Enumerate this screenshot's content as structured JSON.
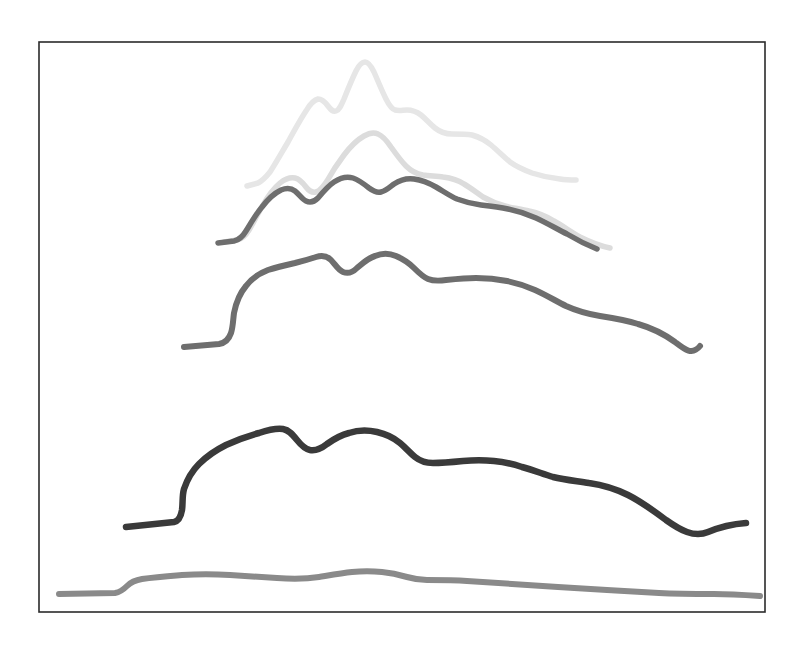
{
  "document": {
    "title": "Nested contour curves",
    "background_color": "#ffffff",
    "width": 807,
    "height": 649
  },
  "frame": {
    "name": "border-frame",
    "x": 39,
    "y": 42,
    "width": 726,
    "height": 570,
    "stroke_color": "#2b2b2b",
    "stroke_width": 1.6
  },
  "chart_data": {
    "type": "line",
    "title": "",
    "subtitle": "",
    "xlabel": "",
    "ylabel": "",
    "grid": false,
    "legend": "none",
    "axis_visible": false,
    "tick_labels": [],
    "annotations": [],
    "xlim": [
      39,
      765
    ],
    "ylim": [
      42,
      612
    ],
    "series": [
      {
        "name": "contour-1-topmost",
        "order": 1,
        "color": "#e6e6e6",
        "stroke_width": 5.5,
        "peak_count": 3,
        "left_end": [
          247,
          186
        ],
        "right_end": [
          576,
          180
        ],
        "apex": [
          364,
          62
        ],
        "path": "M 247 186 L 258 183 C 262 181 266 177 270 172 C 276 163 282 152 288 142 C 294 131 300 120 306 111 C 310 104 314 100 318 99 C 322 99 325 102 328 106 C 331 110 333 112 336 111 C 339 110 341 106 344 99 C 348 89 352 79 356 71 C 359 65 362 62 365 62 C 368 62 371 66 374 72 C 378 81 382 91 386 99 C 389 105 392 109 395 110 C 399 111 403 110 407 110 C 412 110 417 112 421 115 C 426 119 430 124 435 128 C 440 132 446 134 452 134 C 459 134 466 134 472 135 C 479 137 485 140 491 145 C 498 151 504 157 510 162 C 517 167 524 170 532 173 C 541 176 551 178 560 179 C 566 180 572 180 576 180"
      },
      {
        "name": "contour-2-upper",
        "order": 2,
        "color": "#dcdcdc",
        "stroke_width": 5.5,
        "peak_count": 3,
        "left_end": [
          224,
          242
        ],
        "right_end": [
          610,
          248
        ],
        "apex": [
          371,
          133
        ],
        "path": "M 224 242 L 237 240 C 242 239 246 235 249 230 C 254 222 258 213 263 205 C 268 196 274 188 280 183 C 285 179 290 177 295 178 C 300 179 303 183 306 187 C 309 191 312 193 316 192 C 320 191 323 187 327 181 C 332 172 338 163 344 155 C 350 147 357 140 364 136 C 369 133 374 132 378 134 C 383 136 387 141 391 147 C 396 154 401 161 406 166 C 411 171 417 174 423 175 C 430 176 437 176 443 177 C 451 178 458 180 464 184 C 471 188 477 193 483 197 C 490 201 497 204 505 206 C 513 208 521 209 529 211 C 538 213 546 216 554 221 C 563 226 571 232 580 237 C 590 242 600 246 610 248"
      },
      {
        "name": "contour-3-middle",
        "order": 3,
        "color": "#6e6e6e",
        "stroke_width": 5.5,
        "peak_count": 3,
        "left_end": [
          218,
          243
        ],
        "right_end": [
          597,
          249
        ],
        "apex": [
          372,
          182
        ],
        "path": "M 218 243 L 234 241 C 239 240 243 236 246 231 C 251 223 256 214 262 207 C 268 199 275 193 281 190 C 286 188 291 188 295 191 C 299 194 302 199 306 201 C 310 203 314 202 318 198 C 323 192 328 186 334 182 C 340 178 347 176 353 178 C 359 180 364 184 369 188 C 373 191 377 193 381 192 C 386 191 390 187 394 184 C 400 180 407 178 414 179 C 422 180 429 183 436 187 C 443 191 450 196 457 199 C 465 202 473 204 481 205 C 490 206 499 207 508 209 C 518 211 527 214 536 218 C 547 223 557 229 567 234 C 577 240 587 245 597 249"
      },
      {
        "name": "contour-4-large",
        "order": 4,
        "color": "#6e6e6e",
        "stroke_width": 6,
        "peak_count": 3,
        "left_end": [
          184,
          347
        ],
        "right_end": [
          700,
          346
        ],
        "apex": [
          395,
          255
        ],
        "path": "M 184 347 L 219 344 C 225 343 229 339 231 333 C 233 327 233 320 234 313 C 236 303 240 293 246 286 C 252 278 260 273 268 270 C 277 267 286 265 295 263 C 303 261 310 259 316 257 C 322 255 327 256 331 260 C 335 264 338 270 343 272 C 348 274 353 272 357 268 C 363 263 368 258 375 256 C 382 253 389 253 396 256 C 403 259 409 263 414 268 C 419 273 423 277 428 279 C 433 281 439 281 446 280 C 456 279 466 278 476 278 C 487 278 497 279 507 281 C 517 283 526 286 535 290 C 546 295 556 301 566 306 C 577 311 588 314 600 316 C 613 318 626 320 638 324 C 652 328 664 334 675 342 C 684 349 692 356 700 346"
      },
      {
        "name": "contour-5-dark",
        "order": 5,
        "color": "#3a3a3a",
        "stroke_width": 6.5,
        "peak_count": 3,
        "left_end": [
          126,
          527
        ],
        "right_end": [
          746,
          523
        ],
        "apex": [
          404,
          431
        ],
        "path": "M 126 527 L 174 522 C 179 521 181 516 182 510 C 183 503 182 496 184 489 C 187 480 192 471 199 464 C 207 456 216 450 226 445 C 237 440 248 436 259 433 C 268 430 276 428 283 429 C 289 430 293 435 297 440 C 301 445 305 449 310 450 C 316 451 322 448 327 444 C 334 439 341 435 349 433 C 358 430 368 430 377 432 C 386 434 394 438 400 443 C 406 448 410 453 415 457 C 420 461 426 463 433 463 C 443 463 453 462 463 461 C 474 460 484 460 494 461 C 504 462 513 464 522 467 C 533 470 543 474 553 477 C 565 480 577 481 589 483 C 603 485 616 489 628 495 C 642 502 654 511 666 520 C 680 530 694 538 708 532 C 720 527 733 524 746 523"
      },
      {
        "name": "contour-6-baseline",
        "order": 6,
        "color": "#8a8a8a",
        "stroke_width": 6,
        "peak_count": 1,
        "left_end": [
          59,
          594
        ],
        "right_end": [
          760,
          596
        ],
        "apex": [
          369,
          571
        ],
        "path": "M 59 594 L 115 593 C 121 592 124 589 127 586 C 131 582 136 580 142 579 C 155 577 169 576 182 575 C 198 574 214 574 230 575 C 246 576 262 577 277 578 C 292 579 306 579 319 577 C 331 575 342 573 352 572 C 362 571 372 571 382 572 C 392 573 400 575 407 577 C 414 579 420 580 427 580 C 440 580 454 580 467 581 C 482 582 497 583 512 584 C 528 585 543 586 558 587 C 575 588 591 589 607 590 C 625 591 642 592 659 593 C 678 594 696 594 714 594 C 730 594 745 595 760 596"
      }
    ]
  }
}
